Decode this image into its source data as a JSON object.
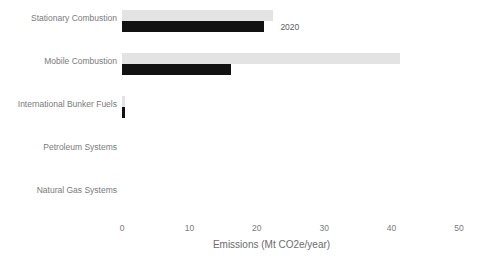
{
  "chart_data": {
    "type": "bar",
    "orientation": "horizontal",
    "title": "",
    "xlabel": "Emissions (Mt CO2e/year)",
    "ylabel": "",
    "xlim": [
      0,
      50
    ],
    "xticks": [
      0,
      10,
      20,
      30,
      40,
      50
    ],
    "xticklabels": [
      "0",
      "10",
      "20",
      "30",
      "40",
      "50"
    ],
    "grid": false,
    "categories": [
      "Stationary Combustion",
      "Mobile Combustion",
      "International Bunker Fuels",
      "Petroleum Systems",
      "Natural Gas Systems"
    ],
    "series": [
      {
        "name": "previous",
        "color": "#e3e3e3",
        "values": [
          22.4,
          41.3,
          0.5,
          0.0,
          0.0
        ]
      },
      {
        "name": "2020",
        "color": "#111111",
        "values": [
          21.0,
          16.2,
          0.5,
          0.0,
          0.0
        ]
      }
    ],
    "annotations": [
      {
        "text": "2020",
        "x": 23.5,
        "category": "Stationary Combustion"
      }
    ]
  },
  "axis": {
    "x_title": "Emissions (Mt CO2e/year)",
    "ticks": [
      "0",
      "10",
      "20",
      "30",
      "40",
      "50"
    ]
  },
  "categories": {
    "c0": "Stationary Combustion",
    "c1": "Mobile Combustion",
    "c2": "International Bunker Fuels",
    "c3": "Petroleum Systems",
    "c4": "Natural Gas Systems"
  },
  "annotation": {
    "series_label": "2020"
  },
  "colors": {
    "previous_bar": "#e3e3e3",
    "current_bar": "#111111",
    "text": "#7a7a7a",
    "background": "#ffffff"
  }
}
